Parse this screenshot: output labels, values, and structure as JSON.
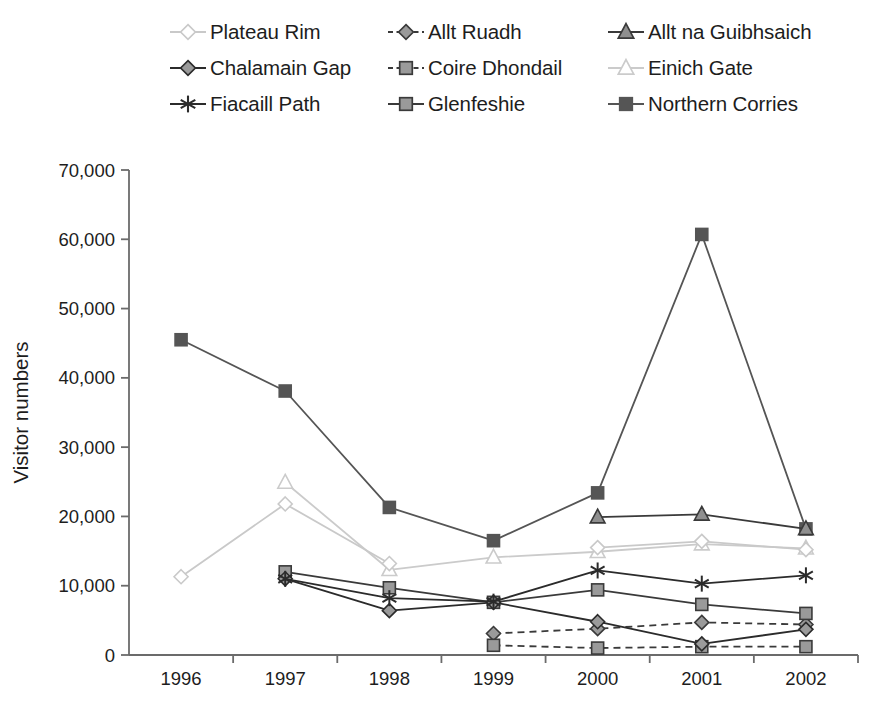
{
  "chart_data": {
    "type": "line",
    "title": "",
    "xlabel": "",
    "ylabel": "Visitor numbers",
    "categories": [
      "1996",
      "1997",
      "1998",
      "1999",
      "2000",
      "2001",
      "2002"
    ],
    "ylim": [
      0,
      70000
    ],
    "ytick_labels": [
      "0",
      "10,000",
      "20,000",
      "30,000",
      "40,000",
      "50,000",
      "60,000",
      "70,000"
    ],
    "ytick_values": [
      0,
      10000,
      20000,
      30000,
      40000,
      50000,
      60000,
      70000
    ],
    "grid": false,
    "legend_position": "top",
    "series": [
      {
        "name": "Plateau Rim",
        "marker": "diamond-open",
        "color": "#c9c9c9",
        "marker_fill": "#ffffff",
        "dash": "solid",
        "values": [
          11300,
          21800,
          13200,
          null,
          15500,
          16400,
          15200
        ]
      },
      {
        "name": "Allt Ruadh",
        "marker": "diamond-filled",
        "color": "#3a3a3a",
        "marker_fill": "#9a9a9a",
        "dash": "dashed",
        "values": [
          null,
          null,
          null,
          3100,
          3800,
          4700,
          4400
        ]
      },
      {
        "name": "Allt na Guibhsaich",
        "marker": "triangle-filled",
        "color": "#3a3a3a",
        "marker_fill": "#8f8f8f",
        "dash": "solid",
        "values": [
          null,
          null,
          null,
          null,
          19900,
          20300,
          18200
        ]
      },
      {
        "name": "Chalamain Gap",
        "marker": "diamond-filled",
        "color": "#2b2b2b",
        "marker_fill": "#9a9a9a",
        "dash": "solid",
        "values": [
          null,
          11000,
          6400,
          7600,
          4800,
          1600,
          3700
        ]
      },
      {
        "name": "Coire Dhondail",
        "marker": "square-filled",
        "color": "#3a3a3a",
        "marker_fill": "#9a9a9a",
        "dash": "dashed",
        "values": [
          null,
          null,
          null,
          1400,
          1000,
          1200,
          1200
        ]
      },
      {
        "name": "Einich Gate",
        "marker": "triangle-open",
        "color": "#cbcbcb",
        "marker_fill": "#ffffff",
        "dash": "solid",
        "values": [
          null,
          24900,
          12300,
          14100,
          14900,
          16000,
          15400
        ]
      },
      {
        "name": "Fiacaill Path",
        "marker": "asterisk",
        "color": "#2b2b2b",
        "marker_fill": "#2b2b2b",
        "dash": "solid",
        "values": [
          null,
          11000,
          8200,
          7700,
          12200,
          10300,
          11500
        ]
      },
      {
        "name": "Glenfeshie",
        "marker": "square-filled",
        "color": "#3a3a3a",
        "marker_fill": "#9a9a9a",
        "dash": "solid",
        "values": [
          null,
          12000,
          9700,
          7600,
          9400,
          7300,
          6000
        ]
      },
      {
        "name": "Northern Corries",
        "marker": "square-filled",
        "color": "#555555",
        "marker_fill": "#555555",
        "dash": "solid",
        "values": [
          45500,
          38100,
          21300,
          16500,
          23400,
          60700,
          18200
        ]
      }
    ]
  },
  "legend": {
    "rows": [
      [
        {
          "label": "Plateau Rim",
          "series": 0
        },
        {
          "label": "Allt Ruadh",
          "series": 1
        },
        {
          "label": "Allt na Guibhsaich",
          "series": 2
        }
      ],
      [
        {
          "label": "Chalamain Gap",
          "series": 3
        },
        {
          "label": "Coire Dhondail",
          "series": 4
        },
        {
          "label": "Einich Gate",
          "series": 5
        }
      ],
      [
        {
          "label": "Fiacaill Path",
          "series": 6
        },
        {
          "label": "Glenfeshie",
          "series": 7
        },
        {
          "label": "Northern Corries",
          "series": 8
        }
      ]
    ]
  },
  "axes": {
    "y_title": "Visitor numbers",
    "axis_color": "#6b6b6b"
  }
}
